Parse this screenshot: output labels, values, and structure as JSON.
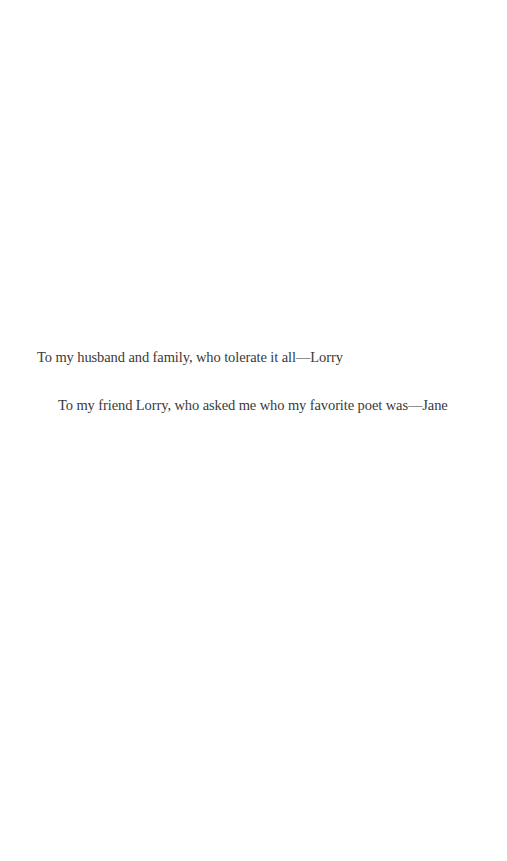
{
  "page": {
    "type": "dedication",
    "dedications": [
      {
        "text": "To my husband and family, who tolerate it all—Lorry"
      },
      {
        "text": "To my friend Lorry, who asked me who my favorite poet was—Jane"
      }
    ]
  }
}
